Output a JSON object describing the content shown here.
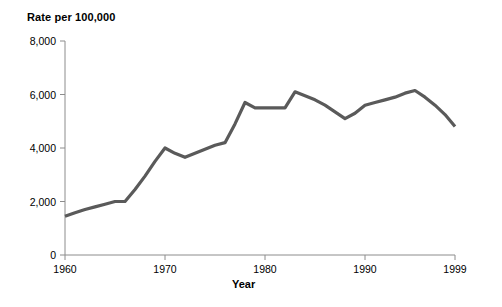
{
  "chart_data": {
    "type": "line",
    "title": "Rate per 100,000",
    "xlabel": "Year",
    "ylabel": "Rate per 100,000",
    "xlim": [
      1960,
      1999
    ],
    "ylim": [
      0,
      8000
    ],
    "grid": false,
    "legend": null,
    "line_color": "#5a5a5a",
    "axis_color": "#8c8c8c",
    "x_ticks": [
      1960,
      1970,
      1980,
      1990,
      1999
    ],
    "x_tick_labels": [
      "1960",
      "1970",
      "1980",
      "1990",
      "1999"
    ],
    "y_ticks": [
      0,
      2000,
      4000,
      6000,
      8000
    ],
    "y_tick_labels": [
      "0",
      "2,000",
      "4,000",
      "6,000",
      "8,000"
    ],
    "x": [
      1960,
      1961,
      1962,
      1963,
      1964,
      1965,
      1966,
      1967,
      1968,
      1969,
      1970,
      1971,
      1972,
      1973,
      1974,
      1975,
      1976,
      1977,
      1978,
      1979,
      1980,
      1981,
      1982,
      1983,
      1984,
      1985,
      1986,
      1987,
      1988,
      1989,
      1990,
      1991,
      1992,
      1993,
      1994,
      1995,
      1996,
      1997,
      1998,
      1999
    ],
    "values": [
      1450,
      1580,
      1700,
      1800,
      1900,
      2000,
      2000,
      2450,
      2950,
      3500,
      4000,
      3800,
      3650,
      3800,
      3950,
      4100,
      4200,
      4900,
      5700,
      5500,
      5500,
      5500,
      5500,
      6100,
      5950,
      5800,
      5600,
      5350,
      5100,
      5300,
      5600,
      5700,
      5800,
      5900,
      6050,
      6150,
      5900,
      5600,
      5250,
      4800
    ]
  }
}
